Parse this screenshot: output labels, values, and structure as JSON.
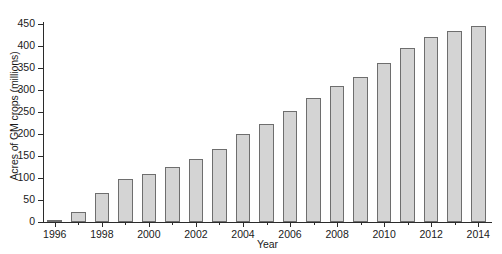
{
  "chart_data": {
    "type": "bar",
    "title": "",
    "xlabel": "Year",
    "ylabel": "Acres of GM crops (millions)",
    "categories": [
      "1996",
      "1997",
      "1998",
      "1999",
      "2000",
      "2001",
      "2002",
      "2003",
      "2004",
      "2005",
      "2006",
      "2007",
      "2008",
      "2009",
      "2010",
      "2011",
      "2012",
      "2013",
      "2014"
    ],
    "values": [
      4,
      22,
      66,
      98,
      108,
      125,
      143,
      167,
      200,
      222,
      253,
      282,
      308,
      330,
      362,
      395,
      420,
      433,
      445
    ],
    "ylim": [
      0,
      450
    ],
    "yticks": [
      0,
      50,
      100,
      150,
      200,
      250,
      300,
      350,
      400,
      450
    ],
    "ytick_labels": [
      "0",
      "50",
      "100",
      "150",
      "200",
      "250",
      "300",
      "350",
      "400",
      "450"
    ],
    "xtick_labels": [
      "1996",
      "1998",
      "2000",
      "2002",
      "2004",
      "2006",
      "2008",
      "2010",
      "2012",
      "2014"
    ],
    "grid": false,
    "legend": null,
    "series_name": "Acres of GM crops (millions)",
    "bar_fill_color": "#d4d4d4",
    "bar_edge_color": "#6e6e6e",
    "axis_color": "#2b2b2b",
    "background_color": "#ffffff"
  }
}
